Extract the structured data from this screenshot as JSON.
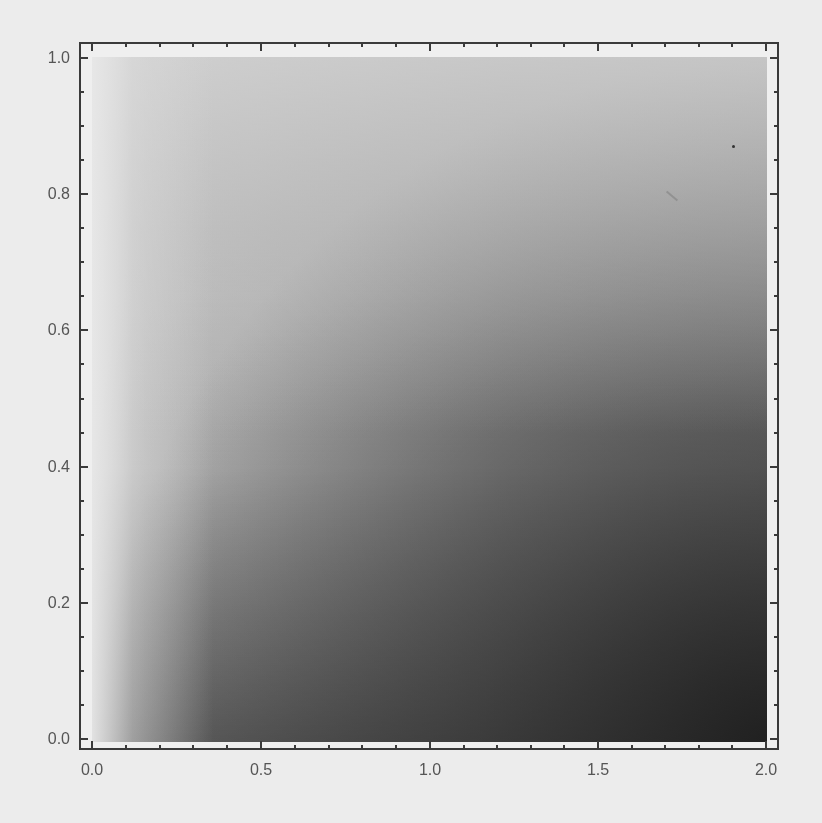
{
  "chart_data": {
    "type": "heatmap",
    "title": "",
    "xlabel": "",
    "ylabel": "",
    "xlim": [
      0.0,
      2.0
    ],
    "ylim": [
      0.0,
      1.0
    ],
    "grid": false,
    "legend": null,
    "colormap": "grayscale (light = high, dark = low)",
    "x_ticks": [
      "0.0",
      "0.5",
      "1.0",
      "1.5",
      "2.0"
    ],
    "y_ticks": [
      "0.0",
      "0.2",
      "0.4",
      "0.6",
      "0.8",
      "1.0"
    ],
    "shade_samples": [
      {
        "x": 0.05,
        "y": 0.95,
        "gray": "#dedede"
      },
      {
        "x": 1.0,
        "y": 0.95,
        "gray": "#d0d0d0"
      },
      {
        "x": 1.9,
        "y": 0.95,
        "gray": "#c8c8c8"
      },
      {
        "x": 0.05,
        "y": 0.05,
        "gray": "#c8c8c8"
      },
      {
        "x": 1.0,
        "y": 0.5,
        "gray": "#a8a8a8"
      },
      {
        "x": 1.0,
        "y": 0.05,
        "gray": "#6e6e6e"
      },
      {
        "x": 1.9,
        "y": 0.5,
        "gray": "#8a8a8a"
      },
      {
        "x": 1.9,
        "y": 0.05,
        "gray": "#3a3a3a"
      }
    ]
  },
  "axes": {
    "x": {
      "ticks": [
        {
          "label": "0.0",
          "px": 92
        },
        {
          "label": "0.5",
          "px": 261
        },
        {
          "label": "1.0",
          "px": 430
        },
        {
          "label": "1.5",
          "px": 598
        },
        {
          "label": "2.0",
          "px": 766
        }
      ]
    },
    "y": {
      "ticks": [
        {
          "label": "1.0",
          "px": 58
        },
        {
          "label": "0.8",
          "px": 194
        },
        {
          "label": "0.6",
          "px": 330
        },
        {
          "label": "0.4",
          "px": 467
        },
        {
          "label": "0.2",
          "px": 603
        },
        {
          "label": "0.0",
          "px": 739
        }
      ]
    }
  }
}
